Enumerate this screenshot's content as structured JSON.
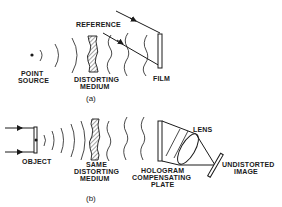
{
  "diagram": {
    "panel_a": {
      "caption": "(a)",
      "labels": {
        "point_source_1": "POINT",
        "point_source_2": "SOURCE",
        "reference": "REFERENCE",
        "distorting_medium_1": "DISTORTING",
        "distorting_medium_2": "MEDIUM",
        "film": "FILM"
      }
    },
    "panel_b": {
      "caption": "(b)",
      "labels": {
        "object": "OBJECT",
        "same_medium_1": "SAME",
        "same_medium_2": "DISTORTING",
        "same_medium_3": "MEDIUM",
        "hologram_1": "HOLOGRAM",
        "hologram_2": "COMPENSATING",
        "hologram_3": "PLATE",
        "lens": "LENS",
        "image_1": "UNDISTORTED",
        "image_2": "IMAGE"
      }
    },
    "colors": {
      "ink": "#1a1a1a",
      "background": "#ffffff"
    }
  }
}
